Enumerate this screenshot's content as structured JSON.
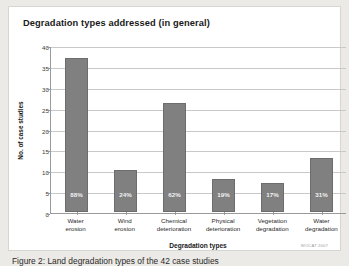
{
  "panel": {
    "title": "Degradation types addressed (in general)",
    "credit": "WOCAT 2007"
  },
  "caption": {
    "text": "Figure 2: Land degradation types of the 42 case studies"
  },
  "chart_data": {
    "type": "bar",
    "title": "Degradation types addressed (in general)",
    "xlabel": "Degradation types",
    "ylabel": "No. of case studies",
    "categories": [
      "Water erosion",
      "Wind erosion",
      "Chemical deterioration",
      "Physical deterioration",
      "Vegetation degradation",
      "Water degradation"
    ],
    "category_lines": [
      [
        "Water",
        "erosion"
      ],
      [
        "Wind",
        "erosion"
      ],
      [
        "Chemical",
        "deterioration"
      ],
      [
        "Physical",
        "deterioration"
      ],
      [
        "Vegetation",
        "degradation"
      ],
      [
        "Water",
        "degradation"
      ]
    ],
    "values": [
      37,
      10,
      26,
      8,
      7,
      13
    ],
    "data_labels": [
      "88%",
      "24%",
      "62%",
      "19%",
      "17%",
      "31%"
    ],
    "ylim": [
      0,
      40
    ],
    "yticks": [
      0,
      5,
      10,
      15,
      20,
      25,
      30,
      35,
      40
    ],
    "ytick_labels": [
      "0",
      "5",
      "10",
      "15",
      "20",
      "25",
      "30",
      "35",
      "40"
    ],
    "grid": true,
    "legend": false,
    "bar_color": "#808080"
  }
}
